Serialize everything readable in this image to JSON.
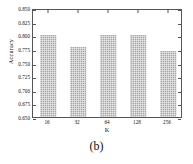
{
  "caption": "(b)",
  "chart_data": {
    "type": "bar",
    "title": "",
    "subtitle": "",
    "xlabel": "K",
    "ylabel": "Accuracy",
    "categories": [
      "16",
      "32",
      "64",
      "128",
      "256"
    ],
    "values": [
      0.8,
      0.779,
      0.8,
      0.8,
      0.771
    ],
    "series": [
      {
        "name": "Accuracy",
        "values": [
          0.8,
          0.779,
          0.8,
          0.8,
          0.771
        ]
      }
    ],
    "ylim": [
      0.65,
      0.85
    ],
    "xlim_categories": 5,
    "ytick_labels": [
      "0.650",
      "0.675",
      "0.700",
      "0.725",
      "0.750",
      "0.775",
      "0.800",
      "0.825",
      "0.850"
    ],
    "ytick_values": [
      0.65,
      0.675,
      0.7,
      0.725,
      0.75,
      0.775,
      0.8,
      0.825,
      0.85
    ],
    "xtick_labels": [
      "16",
      "32",
      "64",
      "128",
      "256"
    ],
    "grid": false,
    "legend": false,
    "legend_position": "none",
    "bar_color": "#a8a8a8",
    "bar_pattern": "crosshatch",
    "frame_color": "#555555",
    "background_color": "#ffffff",
    "text_color": "#111111",
    "tick_direction": "in",
    "annotations": []
  }
}
